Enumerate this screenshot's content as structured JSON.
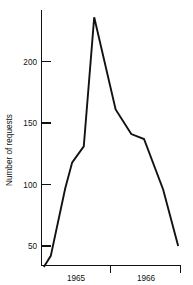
{
  "chart_data": {
    "type": "line",
    "title": "",
    "subtitle": "",
    "xlabel": "",
    "ylabel": "Number of requests",
    "ylim": [
      30,
      240
    ],
    "xlim": [
      0,
      24
    ],
    "grid": false,
    "legend": null,
    "y_ticks": [
      50,
      100,
      150,
      200
    ],
    "y_tick_labels": [
      "50",
      "100",
      "150",
      "200"
    ],
    "x_tick_labels": [
      "1965",
      "1966"
    ],
    "x_group_boundaries": [
      0,
      12,
      24
    ],
    "annotations": [],
    "series": [
      {
        "name": "Number of requests",
        "color": "#121212",
        "x": [
          0.4,
          1.6,
          4.1,
          5.3,
          7.3,
          9.1,
          12.8,
          15.5,
          17.7,
          21.0,
          23.6
        ],
        "values": [
          33,
          42,
          97,
          118,
          131,
          236,
          161,
          141,
          137,
          96,
          50
        ]
      }
    ]
  },
  "labels": {
    "y_axis_title": "Number of requests",
    "y_tick_50": "50",
    "y_tick_100": "100",
    "y_tick_150": "150",
    "y_tick_200": "200",
    "x_label_1965": "1965",
    "x_label_1966": "1966"
  },
  "colors": {
    "line": "#121212",
    "axis": "#111111",
    "background": "#ffffff"
  }
}
